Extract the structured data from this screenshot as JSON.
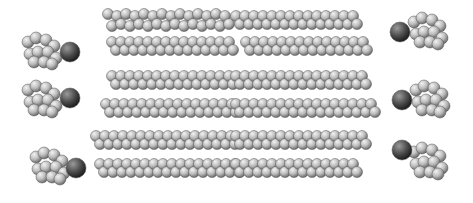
{
  "image": {
    "width": 473,
    "height": 203,
    "background": "#ffffff",
    "subject": "space-filling molecular model of stacked lipid chains",
    "colors": {
      "atom_light": "#d8d8d8",
      "atom_mid": "#9a9a9a",
      "atom_dark": "#4a4a4a",
      "heteroatom": "#3a3a3a"
    },
    "chains": [
      {
        "y": 20,
        "x1": 108,
        "x2": 228
      },
      {
        "y": 20,
        "x1": 236,
        "x2": 360
      },
      {
        "y": 46,
        "x1": 112,
        "x2": 236
      },
      {
        "y": 46,
        "x1": 246,
        "x2": 366
      },
      {
        "y": 80,
        "x1": 112,
        "x2": 236
      },
      {
        "y": 80,
        "x1": 236,
        "x2": 370
      },
      {
        "y": 108,
        "x1": 106,
        "x2": 236
      },
      {
        "y": 108,
        "x1": 236,
        "x2": 372
      },
      {
        "y": 140,
        "x1": 96,
        "x2": 236
      },
      {
        "y": 140,
        "x1": 236,
        "x2": 364
      },
      {
        "y": 168,
        "x1": 100,
        "x2": 236
      },
      {
        "y": 168,
        "x1": 236,
        "x2": 356
      }
    ],
    "headgroups": [
      {
        "x": 42,
        "y": 50
      },
      {
        "x": 42,
        "y": 98
      },
      {
        "x": 50,
        "y": 165
      },
      {
        "x": 428,
        "y": 30
      },
      {
        "x": 430,
        "y": 98
      },
      {
        "x": 428,
        "y": 160
      }
    ],
    "dark_atoms": [
      {
        "x": 70,
        "y": 52,
        "r": 10
      },
      {
        "x": 70,
        "y": 98,
        "r": 10
      },
      {
        "x": 76,
        "y": 168,
        "r": 10
      },
      {
        "x": 400,
        "y": 32,
        "r": 10
      },
      {
        "x": 402,
        "y": 100,
        "r": 10
      },
      {
        "x": 402,
        "y": 150,
        "r": 10
      }
    ]
  }
}
